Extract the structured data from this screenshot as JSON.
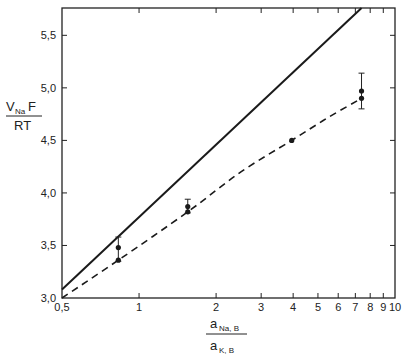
{
  "chart_data": {
    "type": "line",
    "title": "",
    "xscale": "log",
    "xlim": [
      0.5,
      10
    ],
    "ylim": [
      3.0,
      5.76
    ],
    "grid": false,
    "legend": "none",
    "xlabel": {
      "numerator_main": "a",
      "numerator_sub": "Na, B",
      "denominator_main": "a",
      "denominator_sub": "K, B"
    },
    "ylabel": {
      "numerator_main": "V",
      "numerator_sub": "Na",
      "numerator_tail": " F",
      "denominator": "RT"
    },
    "x_ticks": [
      {
        "value": 0.5,
        "label": "0,5"
      },
      {
        "value": 1,
        "label": "1"
      },
      {
        "value": 2,
        "label": "2"
      },
      {
        "value": 3,
        "label": "3"
      },
      {
        "value": 4,
        "label": "4"
      },
      {
        "value": 5,
        "label": "5"
      },
      {
        "value": 6,
        "label": "6"
      },
      {
        "value": 7,
        "label": "7"
      },
      {
        "value": 8,
        "label": "8"
      },
      {
        "value": 9,
        "label": "9"
      },
      {
        "value": 10,
        "label": "10"
      }
    ],
    "y_ticks": [
      {
        "value": 3.0,
        "label": "3,0"
      },
      {
        "value": 3.5,
        "label": "3,5"
      },
      {
        "value": 4.0,
        "label": "4,0"
      },
      {
        "value": 4.5,
        "label": "4,5"
      },
      {
        "value": 5.0,
        "label": "5,0"
      },
      {
        "value": 5.5,
        "label": "5,5"
      }
    ],
    "series": [
      {
        "name": "theoretical (Nernst slope)",
        "style": "solid",
        "x": [
          0.5,
          7.4
        ],
        "y": [
          3.08,
          5.76
        ]
      },
      {
        "name": "fitted curve",
        "style": "dashed",
        "x": [
          0.5,
          0.83,
          1.55,
          2.5,
          3.95,
          5.5,
          7.4
        ],
        "y": [
          3.0,
          3.36,
          3.82,
          4.2,
          4.5,
          4.72,
          4.9
        ]
      },
      {
        "name": "measured",
        "style": "points",
        "points": [
          {
            "x": 0.83,
            "y": 3.48,
            "yerr_low": 3.35,
            "yerr_high": 3.58
          },
          {
            "x": 0.83,
            "y": 3.36
          },
          {
            "x": 1.55,
            "y": 3.87,
            "yerr_low": 3.81,
            "yerr_high": 3.94
          },
          {
            "x": 1.55,
            "y": 3.82
          },
          {
            "x": 3.95,
            "y": 4.5
          },
          {
            "x": 7.4,
            "y": 4.97,
            "yerr_low": 4.8,
            "yerr_high": 5.14
          },
          {
            "x": 7.4,
            "y": 4.9
          }
        ]
      }
    ]
  }
}
